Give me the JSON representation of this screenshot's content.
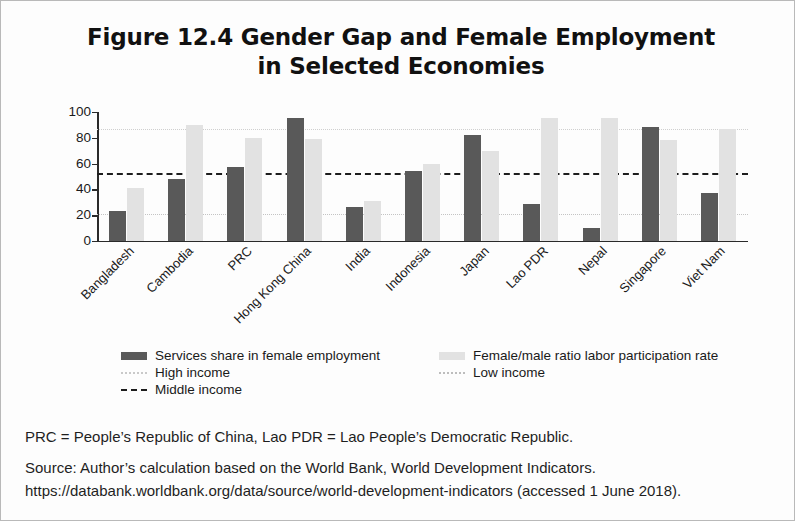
{
  "figure": {
    "title_line_1": "Figure 12.4  Gender Gap and Female Employment",
    "title_line_2": "in Selected Economies"
  },
  "notes": {
    "abbreviations": "PRC = People’s Republic of China, Lao PDR = Lao People’s Democratic Republic.",
    "source": "Source: Author’s calculation based on the World Bank, World Development Indicators.",
    "source_url": "https://databank.worldbank.org/data/source/world-development-indicators (accessed 1 June 2018)."
  },
  "colors": {
    "services_bar": "#595959",
    "ratio_bar": "#e2e2e2",
    "high_income_line": "#cfcfcf",
    "middle_income_line": "#1d1d1d",
    "low_income_line": "#c4c4c4",
    "axis": "#2a2a2a"
  },
  "chart_data": {
    "type": "bar",
    "title": "Figure 12.4  Gender Gap and Female Employment in Selected Economies",
    "xlabel": "",
    "ylabel": "",
    "ylim": [
      0,
      100
    ],
    "yticks": [
      0,
      20,
      40,
      60,
      80,
      100
    ],
    "ytick_labels": [
      "0",
      "20",
      "40",
      "60",
      "80",
      "100"
    ],
    "grid": false,
    "legend_position": "bottom",
    "categories": [
      "Bangladesh",
      "Cambodia",
      "PRC",
      "Hong Kong, China",
      "India",
      "Indonesia",
      "Japan",
      "Lao PDR",
      "Nepal",
      "Singapore",
      "Viet Nam"
    ],
    "series": [
      {
        "name": "Services share in female employment",
        "color": "#595959",
        "values": [
          23,
          48,
          57,
          95,
          26,
          54,
          82,
          29,
          10,
          88,
          37
        ]
      },
      {
        "name": "Female/male ratio labor participation rate",
        "color": "#e2e2e2",
        "values": [
          41,
          90,
          80,
          79,
          31,
          60,
          70,
          95,
          95,
          78,
          87
        ]
      }
    ],
    "reference_lines": [
      {
        "name": "High income",
        "value": 87,
        "style": "dotted",
        "color": "#cfcfcf"
      },
      {
        "name": "Middle income",
        "value": 53,
        "style": "dashed",
        "color": "#1d1d1d"
      },
      {
        "name": "Low income",
        "value": 21,
        "style": "dotted",
        "color": "#c4c4c4"
      }
    ],
    "legend_entries": [
      {
        "label": "Services share in female employment",
        "marker": "dark-bar"
      },
      {
        "label": "Female/male ratio labor participation rate",
        "marker": "light-bar"
      },
      {
        "label": "High income",
        "marker": "dotted-light"
      },
      {
        "label": "Low income",
        "marker": "dotted-light"
      },
      {
        "label": "Middle income",
        "marker": "dashed-dark"
      }
    ]
  }
}
